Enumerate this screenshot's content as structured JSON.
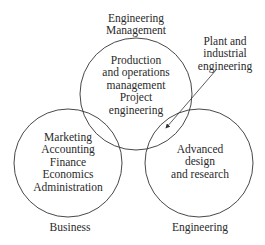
{
  "diagram": {
    "type": "venn",
    "circles": [
      {
        "id": "engineering-management",
        "title": "Engineering\nManagement",
        "contents": "Production\nand operations\nmanagement\nProject\nengineering"
      },
      {
        "id": "business",
        "title": "Business",
        "contents": "Marketing\nAccounting\nFinance\nEconomics\nAdministration"
      },
      {
        "id": "engineering",
        "title": "Engineering",
        "contents": "Advanced\ndesign\nand research"
      }
    ],
    "callout": {
      "text": "Plant and\nindustrial\nengineering",
      "points_to": "engineering-management ∩ engineering"
    },
    "colors": {
      "stroke": "#333333",
      "text": "#2a2a2a",
      "background": "#ffffff"
    }
  }
}
